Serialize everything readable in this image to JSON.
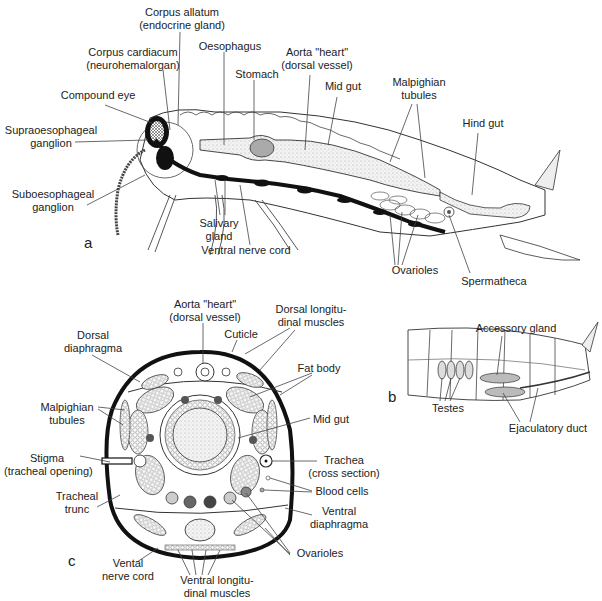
{
  "figure": {
    "panels": [
      {
        "id": "a",
        "letter": "a",
        "description": "Longitudinal section of female insect body",
        "labels": {
          "corpus_allatum": [
            "Corpus allatum",
            "(endocrine gland)"
          ],
          "corpus_cardiacum": [
            "Corpus cardiacum",
            "(neurohemalorgan)"
          ],
          "oesophagus": "Oesophagus",
          "aorta": [
            "Aorta \"heart\"",
            "(dorsal vessel)"
          ],
          "stomach": "Stomach",
          "mid_gut": "Mid gut",
          "malpighian": [
            "Malpighian",
            "tubules"
          ],
          "hind_gut": "Hind gut",
          "compound_eye": "Compound eye",
          "supraoesophageal": [
            "Supraoesophageal",
            "ganglion"
          ],
          "suboesophageal": [
            "Suboesophageal",
            "ganglion"
          ],
          "salivary": [
            "Salivary",
            "gland"
          ],
          "ventral_nerve_cord": "Ventral nerve cord",
          "ovarioles": "Ovarioles",
          "spermatheca": "Spermatheca"
        }
      },
      {
        "id": "b",
        "letter": "b",
        "description": "Male abdomen, side view",
        "labels": {
          "accessory_gland": "Accessory gland",
          "testes": "Testes",
          "ejaculatory_duct": "Ejaculatory duct"
        }
      },
      {
        "id": "c",
        "letter": "c",
        "description": "Cross section of insect abdomen",
        "labels": {
          "aorta": [
            "Aorta \"heart\"",
            "(dorsal vessel)"
          ],
          "dorsal_longitudinal": [
            "Dorsal longitu-",
            "dinal muscles"
          ],
          "dorsal_diaphragma": [
            "Dorsal",
            "diaphragma"
          ],
          "cuticle": "Cuticle",
          "fat_body": "Fat body",
          "malpighian": [
            "Malpighian",
            "tubules"
          ],
          "mid_gut": "Mid gut",
          "stigma": [
            "Stigma",
            "(tracheal opening)"
          ],
          "trachea": [
            "Trachea",
            "(cross section)"
          ],
          "blood_cells": "Blood cells",
          "tracheal_trunc": [
            "Tracheal",
            "trunc"
          ],
          "ventral_diaphragma": [
            "Ventral",
            "diaphragma"
          ],
          "ovarioles": "Ovarioles",
          "vental_nerve_cord": [
            "Vental",
            "nerve cord"
          ],
          "ventral_longitudinal": [
            "Ventral longitu-",
            "dinal muscles"
          ]
        }
      }
    ]
  }
}
